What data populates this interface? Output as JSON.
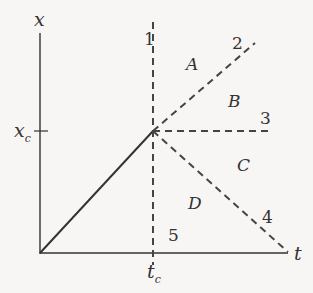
{
  "diagram": {
    "axes": {
      "vertical_label": "x",
      "horizontal_label": "t",
      "x_tick_label": "x",
      "x_tick_sub": "c",
      "t_tick_label": "t",
      "t_tick_sub": "c"
    },
    "lines": [
      {
        "id": "1",
        "label": "1",
        "style": "dashed",
        "direction": "vertical through t_c"
      },
      {
        "id": "2",
        "label": "2",
        "style": "dashed",
        "direction": "diagonal up-right from (t_c, x_c)"
      },
      {
        "id": "3",
        "label": "3",
        "style": "dashed",
        "direction": "horizontal right from (t_c, x_c)"
      },
      {
        "id": "4",
        "label": "4",
        "style": "dashed",
        "direction": "diagonal down-right from (t_c, x_c) to t-axis"
      },
      {
        "id": "5",
        "label": "5",
        "style": "dashed",
        "direction": "vertical below (t_c, x_c)"
      }
    ],
    "regions": [
      "A",
      "B",
      "C",
      "D"
    ],
    "solid_trajectory": "line from origin to (t_c, x_c)",
    "colors": {
      "ink": "#333333",
      "background": "#f7f6f4"
    }
  }
}
